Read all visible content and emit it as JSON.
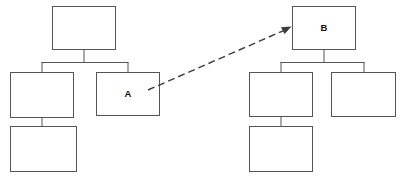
{
  "diagram": {
    "type": "tree-hierarchy-pair",
    "canvas": {
      "width": 405,
      "height": 178,
      "background": "#ffffff"
    },
    "style": {
      "node_fill": "#ffffff",
      "node_stroke": "#555555",
      "connector_stroke": "#555555",
      "link_stroke": "#3b3b3b",
      "link_dash": "7 4"
    },
    "trees": [
      {
        "name": "left-tree",
        "root": {
          "id": "L0",
          "label": "",
          "x": 52,
          "y": 6,
          "w": 64,
          "h": 44
        },
        "nodes": [
          {
            "id": "L1",
            "label": "",
            "x": 10,
            "y": 72,
            "w": 64,
            "h": 46,
            "parent": "L0"
          },
          {
            "id": "L2",
            "label": "A",
            "x": 96,
            "y": 72,
            "w": 64,
            "h": 44,
            "parent": "L0"
          },
          {
            "id": "L3",
            "label": "",
            "x": 10,
            "y": 126,
            "w": 67,
            "h": 46,
            "parent": "L1"
          }
        ]
      },
      {
        "name": "right-tree",
        "root": {
          "id": "R0",
          "label": "B",
          "x": 292,
          "y": 6,
          "w": 64,
          "h": 44
        },
        "nodes": [
          {
            "id": "R1",
            "label": "",
            "x": 249,
            "y": 72,
            "w": 64,
            "h": 45,
            "parent": "R0"
          },
          {
            "id": "R2",
            "label": "",
            "x": 331,
            "y": 72,
            "w": 65,
            "h": 45,
            "parent": "R0"
          },
          {
            "id": "R3",
            "label": "",
            "x": 249,
            "y": 126,
            "w": 64,
            "h": 46,
            "parent": "R1"
          }
        ]
      }
    ],
    "cross_link": {
      "name": "a-to-b-link",
      "from_node": "A",
      "to_node": "B",
      "style": "dashed",
      "arrow_at": "to",
      "from_point": {
        "x": 148,
        "y": 90
      },
      "to_point": {
        "x": 291,
        "y": 27
      }
    },
    "labels": {
      "node_a": "A",
      "node_b": "B"
    }
  }
}
